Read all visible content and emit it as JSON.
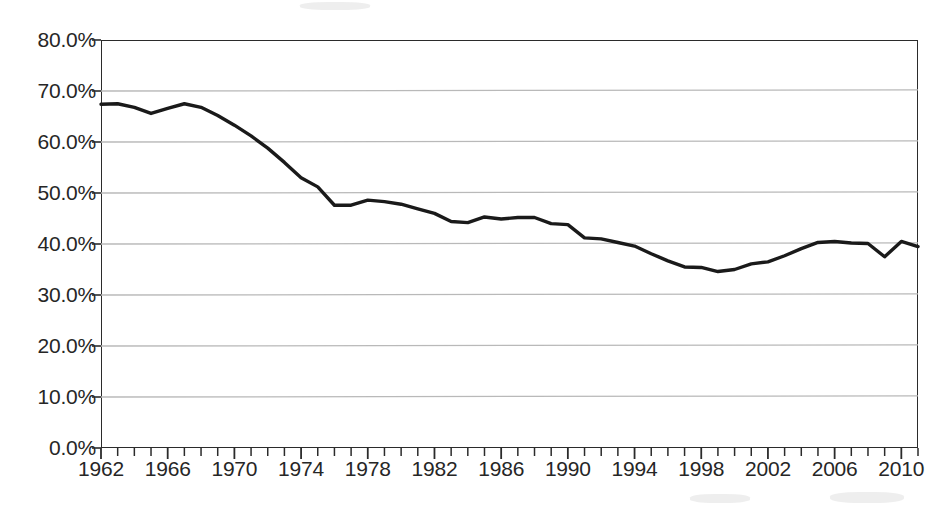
{
  "chart_data": {
    "type": "line",
    "title": "",
    "subtitle": "",
    "xlabel": "",
    "ylabel": "",
    "xlim": [
      1962,
      2011
    ],
    "ylim": [
      0,
      80
    ],
    "grid": true,
    "legend": false,
    "legend_position": "none",
    "y_tick_labels": [
      "80.0%",
      "70.0%",
      "60.0%",
      "50.0%",
      "40.0%",
      "30.0%",
      "20.0%",
      "10.0%",
      "0.0%"
    ],
    "y_tick_values": [
      80,
      70,
      60,
      50,
      40,
      30,
      20,
      10,
      0
    ],
    "x_tick_labels": [
      "1962",
      "1966",
      "1970",
      "1974",
      "1978",
      "1982",
      "1986",
      "1990",
      "1994",
      "1998",
      "2002",
      "2006",
      "2010"
    ],
    "x_tick_values": [
      1962,
      1966,
      1970,
      1974,
      1978,
      1982,
      1986,
      1990,
      1994,
      1998,
      2002,
      2006,
      2010
    ],
    "x_minor_tick_step": 1,
    "series": [
      {
        "name": "",
        "color": "#1a1a1a",
        "line_width": 3.4,
        "x": [
          1962,
          1963,
          1964,
          1965,
          1966,
          1967,
          1968,
          1969,
          1970,
          1971,
          1972,
          1973,
          1974,
          1975,
          1976,
          1977,
          1978,
          1979,
          1980,
          1981,
          1982,
          1983,
          1984,
          1985,
          1986,
          1987,
          1988,
          1989,
          1990,
          1991,
          1992,
          1993,
          1994,
          1995,
          1996,
          1997,
          1998,
          1999,
          2000,
          2001,
          2002,
          2003,
          2004,
          2005,
          2006,
          2007,
          2008,
          2009,
          2010,
          2011
        ],
        "values": [
          67.4,
          67.5,
          66.8,
          65.6,
          66.6,
          67.5,
          66.8,
          65.2,
          63.3,
          61.2,
          58.8,
          56.0,
          53.0,
          51.2,
          47.6,
          47.6,
          48.6,
          48.3,
          47.8,
          46.9,
          46.0,
          44.4,
          44.2,
          45.3,
          44.9,
          45.2,
          45.2,
          44.0,
          43.8,
          41.2,
          41.0,
          40.3,
          39.6,
          38.1,
          36.7,
          35.5,
          35.4,
          34.6,
          35.0,
          36.1,
          36.5,
          37.7,
          39.1,
          40.3,
          40.5,
          40.2,
          40.1,
          37.5,
          40.5,
          39.5
        ]
      }
    ]
  },
  "axes": {
    "y_axis_name": "y-axis",
    "x_axis_name": "x-axis"
  }
}
